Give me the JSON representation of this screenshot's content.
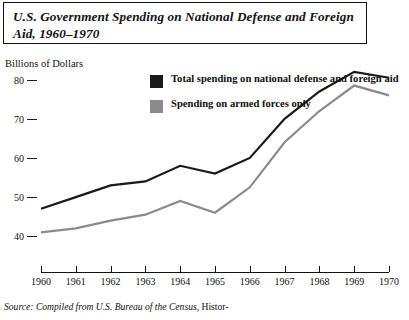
{
  "title": "U.S. Government Spending on National Defense and Foreign Aid, 1960–1970",
  "y_axis_label": "Billions of Dollars",
  "source": {
    "prefix": "Source:",
    "italic_part": "Compiled from U.S. Bureau of the Census,",
    "roman_part": " Histor-"
  },
  "legend": {
    "items": [
      {
        "label": "Total spending on national defense and foreign aid",
        "color": "#1a1a1a",
        "swatch": "legend-swatch-total"
      },
      {
        "label": "Spending on armed forces only",
        "color": "#8a8a8a",
        "swatch": "legend-swatch-armed"
      }
    ]
  },
  "colors": {
    "total_line": "#1a1a1a",
    "armed_line": "#8a8a8a",
    "axis": "#111111",
    "background": "#ffffff",
    "title_border": "#111111"
  },
  "chart_data": {
    "type": "line",
    "title": "U.S. Government Spending on National Defense and Foreign Aid, 1960–1970",
    "xlabel": "",
    "ylabel": "Billions of Dollars",
    "categories": [
      "1960",
      "1961",
      "1962",
      "1963",
      "1964",
      "1965",
      "1966",
      "1967",
      "1968",
      "1969",
      "1970"
    ],
    "x": [
      1960,
      1961,
      1962,
      1963,
      1964,
      1965,
      1966,
      1967,
      1968,
      1969,
      1970
    ],
    "xlim": [
      1960,
      1970
    ],
    "ylim": [
      38,
      84
    ],
    "ytick_values": [
      40,
      50,
      60,
      70,
      80
    ],
    "ytick_labels": [
      "40",
      "50",
      "60",
      "70",
      "80"
    ],
    "grid": false,
    "legend_position": "upper-center",
    "series": [
      {
        "name": "Total spending on national defense and foreign aid",
        "color": "#1a1a1a",
        "values": [
          47.5,
          50.5,
          53.5,
          54.5,
          58.5,
          56.5,
          60.5,
          70.5,
          77.5,
          82.5,
          81.0
        ]
      },
      {
        "name": "Spending on armed forces only",
        "color": "#8a8a8a",
        "values": [
          41.5,
          42.5,
          44.5,
          46.0,
          49.5,
          46.5,
          53.0,
          64.5,
          72.5,
          79.0,
          76.5
        ]
      }
    ]
  }
}
